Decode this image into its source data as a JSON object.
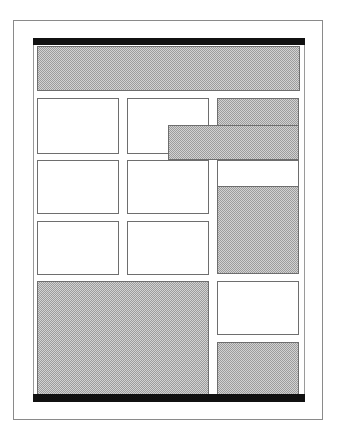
{
  "diagram": {
    "type": "page-layout-wireframe",
    "colors": {
      "bar": "#111111",
      "border": "#6e6e6e",
      "hatch_fill": "#c4c4c4",
      "background": "#ffffff"
    },
    "regions": [
      {
        "id": "top-bar",
        "kind": "bar"
      },
      {
        "id": "header-block",
        "kind": "hatched"
      },
      {
        "id": "r1c1",
        "kind": "empty"
      },
      {
        "id": "r1c2",
        "kind": "empty"
      },
      {
        "id": "r1c3",
        "kind": "hatched"
      },
      {
        "id": "overlap-block",
        "kind": "hatched"
      },
      {
        "id": "r2c1",
        "kind": "empty"
      },
      {
        "id": "r2c2",
        "kind": "empty"
      },
      {
        "id": "r2c3-top",
        "kind": "empty"
      },
      {
        "id": "r2c3-tall",
        "kind": "hatched"
      },
      {
        "id": "r3c1",
        "kind": "empty"
      },
      {
        "id": "r3c2",
        "kind": "empty"
      },
      {
        "id": "bottom-left-block",
        "kind": "hatched"
      },
      {
        "id": "bottom-right-top",
        "kind": "empty"
      },
      {
        "id": "bottom-right-bottom",
        "kind": "hatched"
      },
      {
        "id": "bottom-bar",
        "kind": "bar"
      }
    ]
  }
}
